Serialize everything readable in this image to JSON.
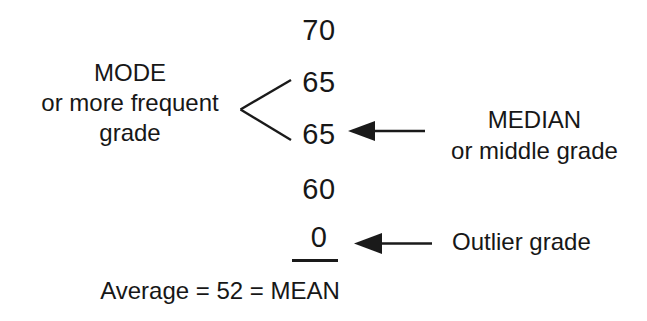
{
  "diagram": {
    "title_text_present": false,
    "grades": [
      {
        "id": "grade-70",
        "value": "70"
      },
      {
        "id": "grade-65a",
        "value": "65"
      },
      {
        "id": "grade-65b",
        "value": "65"
      },
      {
        "id": "grade-60",
        "value": "60"
      },
      {
        "id": "grade-0",
        "value": "0"
      }
    ],
    "mode_label": {
      "line1": "MODE",
      "line2": "or more frequent",
      "line3": "grade"
    },
    "median_label": {
      "line1": "MEDIAN",
      "line2": "or middle grade"
    },
    "outlier_label": "Outlier grade",
    "average_line": "Average = 52 = MEAN",
    "colors": {
      "ink": "#1a1a1a",
      "background": "#ffffff"
    },
    "annotations": {
      "mode_bracket": "angle-bracket-pointing-left-connecting-two-65-values",
      "median_arrow": "left-pointing-arrow-to-second-65",
      "outlier_arrow": "left-pointing-arrow-to-zero",
      "sum_rule": "horizontal-rule-under-zero"
    }
  }
}
